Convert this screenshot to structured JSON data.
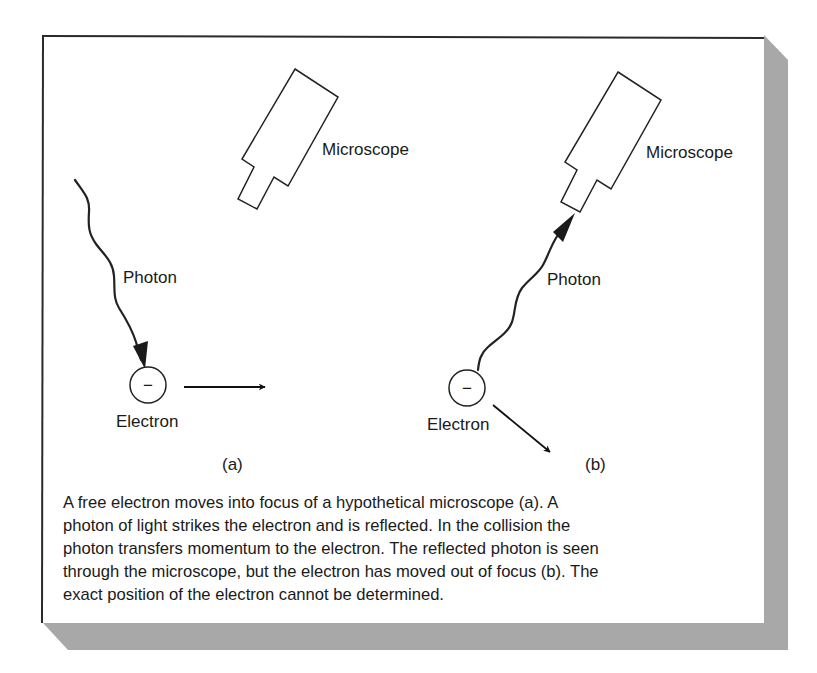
{
  "figure": {
    "panels": [
      {
        "id": "a",
        "panel_label": "(a)",
        "microscope_label": "Microscope",
        "photon_label": "Photon",
        "electron_label": "Electron",
        "electron_symbol": "−",
        "description": "Photon travels downward toward the electron; electron moves right"
      },
      {
        "id": "b",
        "panel_label": "(b)",
        "microscope_label": "Microscope",
        "photon_label": "Photon",
        "electron_label": "Electron",
        "electron_symbol": "−",
        "description": "Photon reflects up into the microscope; electron deflected down-right"
      }
    ],
    "caption_lines": [
      "A free electron moves into focus of a hypothetical microscope (a).  A",
      "photon of light strikes the electron and is reflected.  In the collision the",
      "photon transfers momentum to the electron.  The reflected photon is seen",
      "through the microscope, but the electron has moved out of focus (b).  The",
      "exact position of the electron cannot be determined."
    ],
    "colors": {
      "frame_border": "#2a2a2a",
      "shadow": "#a8a8a8",
      "ink": "#1a1a1a",
      "background": "#ffffff"
    }
  }
}
